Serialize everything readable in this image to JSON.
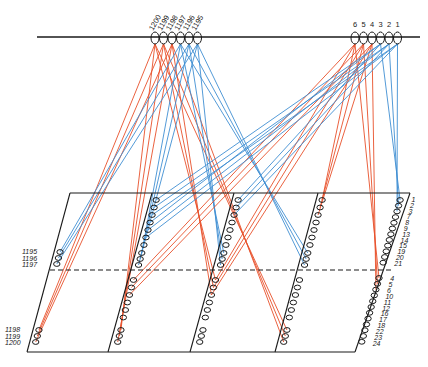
{
  "diagram": {
    "type": "wiring / winding connection diagram",
    "colors": {
      "red_wires": "#e8502a",
      "blue_wires": "#3f8fd2",
      "frame": "#1a1a1a",
      "background": "#ffffff"
    },
    "top_bus": {
      "left_group_labels": [
        "1200",
        "1199",
        "1198",
        "1197",
        "1196",
        "1195"
      ],
      "right_group_labels": [
        "6",
        "5",
        "4",
        "3",
        "2",
        "1"
      ]
    },
    "panel": {
      "left_side_labels_upper": [
        "1195",
        "1196",
        "1197"
      ],
      "left_side_labels_lower": [
        "1198",
        "1199",
        "1200"
      ],
      "right_side_labels_upper": [
        "1",
        "2",
        "3",
        "7",
        "8",
        "9",
        "13",
        "14",
        "15",
        "19",
        "20",
        "21"
      ],
      "right_side_labels_lower": [
        "4",
        "5",
        "6",
        "10",
        "11",
        "12",
        "16",
        "17",
        "18",
        "22",
        "23",
        "24"
      ],
      "divider": "dashed horizontal line"
    }
  }
}
